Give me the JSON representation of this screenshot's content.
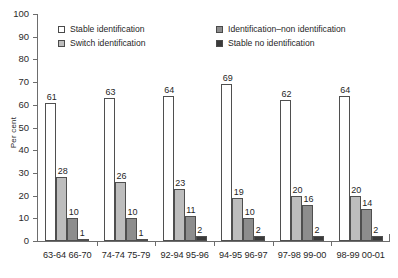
{
  "chart_data": {
    "type": "bar",
    "title": "",
    "xlabel": "",
    "ylabel": "Per cent",
    "ylim": [
      0,
      100
    ],
    "ytick_step": 10,
    "yticks": [
      100,
      90,
      80,
      70,
      60,
      50,
      40,
      30,
      20,
      10,
      0
    ],
    "grid": false,
    "legend_position": "top-inside",
    "categories": [
      "63-64 66-70",
      "74-74 75-79",
      "92-94 95-96",
      "94-95 96-97",
      "97-98 99-00",
      "98-99 00-01"
    ],
    "series": [
      {
        "name": "Stable identification",
        "color": "#ffffff",
        "values": [
          61,
          63,
          64,
          69,
          62,
          64
        ]
      },
      {
        "name": "Switch identification",
        "color": "#bdbdbd",
        "values": [
          28,
          26,
          23,
          19,
          20,
          20
        ]
      },
      {
        "name": "Identification–non identification",
        "color": "#8d8d8d",
        "values": [
          10,
          10,
          11,
          10,
          16,
          14
        ]
      },
      {
        "name": "Stable no identification",
        "color": "#3a3a3a",
        "values": [
          1,
          1,
          2,
          2,
          2,
          2
        ]
      }
    ]
  },
  "axis": {
    "y_title": "Per cent"
  },
  "legend": {
    "items": [
      {
        "label": "Stable identification"
      },
      {
        "label": "Identification–non identification"
      },
      {
        "label": "Switch identification"
      },
      {
        "label": "Stable no identification"
      }
    ]
  }
}
